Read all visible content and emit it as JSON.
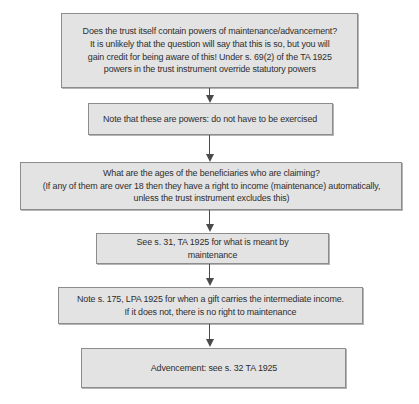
{
  "flowchart": {
    "nodes": [
      {
        "id": "powers-in-trust",
        "text": "Does the trust itself contain powers of maintenance/advancement?\nIt is unlikely that the question will say that this is so, but you will\ngain credit for being aware of this! Under s. 69(2) of the TA 1925\npowers in the trust instrument override statutory powers"
      },
      {
        "id": "powers-not-duties",
        "text": "Note that these are powers: do not have to be exercised"
      },
      {
        "id": "beneficiary-ages",
        "text": "What are the ages of the beneficiaries who are claiming?\n(If any of them are over 18 then they have a right to income (maintenance) automatically,\nunless the trust instrument excludes this)"
      },
      {
        "id": "meaning-of-maintenance",
        "text": "See s. 31, TA 1925 for what is meant by maintenance"
      },
      {
        "id": "intermediate-income",
        "text": "Note s. 175, LPA 1925 for when a gift carries the intermediate income.\nIf it does not, there is no right to maintenance"
      },
      {
        "id": "advancement",
        "text": "Advencement: see s. 32 TA 1925"
      }
    ],
    "edges": [
      {
        "from": "powers-in-trust",
        "to": "powers-not-duties"
      },
      {
        "from": "powers-not-duties",
        "to": "beneficiary-ages"
      },
      {
        "from": "beneficiary-ages",
        "to": "meaning-of-maintenance"
      },
      {
        "from": "meaning-of-maintenance",
        "to": "intermediate-income"
      },
      {
        "from": "intermediate-income",
        "to": "advancement"
      }
    ]
  },
  "colors": {
    "box_fill": "#e3e3e3",
    "box_border": "#8c8c8c",
    "text": "#2e2e2e",
    "arrow": "#4a4a4a",
    "background": "#ffffff"
  }
}
